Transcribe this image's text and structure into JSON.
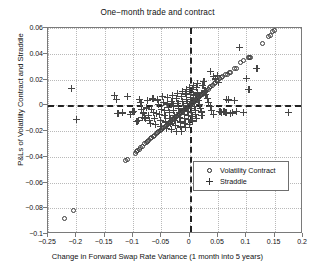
{
  "chart_data": {
    "type": "scatter",
    "title": "One−month trade and contract",
    "xlabel": "Change in Forward Swap Rate Variance (1 month into 5 years)",
    "ylabel": "P&Ls of Volatility Contract and Straddle",
    "xlim": [
      -0.25,
      0.2
    ],
    "ylim": [
      -0.1,
      0.06
    ],
    "xticks": [
      -0.25,
      -0.2,
      -0.15,
      -0.1,
      -0.05,
      0,
      0.05,
      0.1,
      0.15,
      0.2
    ],
    "xtick_labels": [
      "−0.25",
      "−0.2",
      "−0.15",
      "−0.1",
      "−0.05",
      "0",
      "0.05",
      "0.1",
      "0.15",
      "0.2"
    ],
    "yticks": [
      0.06,
      0.04,
      0.02,
      0,
      -0.02,
      -0.04,
      -0.06,
      -0.08,
      -0.1
    ],
    "ytick_labels": [
      "0.06",
      "0.04",
      "0.02",
      "0",
      "−0.02",
      "−0.04",
      "−0.06",
      "−0.08",
      "−0.1"
    ],
    "grid": true,
    "grid_style": "dotted",
    "reference_lines": {
      "vertical_x": 0,
      "horizontal_y": 0,
      "style": "dashed"
    },
    "legend": {
      "position": "lower-right",
      "entries": [
        {
          "label": "Volatility Contract",
          "marker": "circle"
        },
        {
          "label": "Straddle",
          "marker": "plus"
        }
      ]
    },
    "series": [
      {
        "name": "Volatility Contract",
        "marker": "circle",
        "points": [
          [
            -0.2205,
            -0.0882
          ],
          [
            -0.2045,
            -0.0818
          ],
          [
            -0.1135,
            -0.0428
          ],
          [
            -0.1105,
            -0.0425
          ],
          [
            -0.0955,
            -0.0372
          ],
          [
            -0.094,
            -0.036
          ],
          [
            -0.0925,
            -0.0352
          ],
          [
            -0.089,
            -0.034
          ],
          [
            -0.0862,
            -0.033
          ],
          [
            -0.084,
            -0.0318
          ],
          [
            -0.0795,
            -0.03
          ],
          [
            -0.077,
            -0.0292
          ],
          [
            -0.0742,
            -0.028
          ],
          [
            -0.0718,
            -0.0272
          ],
          [
            -0.069,
            -0.0262
          ],
          [
            -0.0665,
            -0.025
          ],
          [
            -0.064,
            -0.0242
          ],
          [
            -0.0615,
            -0.0232
          ],
          [
            -0.0592,
            -0.0222
          ],
          [
            -0.0568,
            -0.0215
          ],
          [
            -0.0545,
            -0.0205
          ],
          [
            -0.0522,
            -0.0196
          ],
          [
            -0.05,
            -0.0188
          ],
          [
            -0.0478,
            -0.018
          ],
          [
            -0.0456,
            -0.0172
          ],
          [
            -0.0435,
            -0.0164
          ],
          [
            -0.0414,
            -0.0156
          ],
          [
            -0.0394,
            -0.0148
          ],
          [
            -0.0374,
            -0.0141
          ],
          [
            -0.0355,
            -0.0134
          ],
          [
            -0.0336,
            -0.0126
          ],
          [
            -0.0318,
            -0.012
          ],
          [
            -0.03,
            -0.0113
          ],
          [
            -0.0283,
            -0.0106
          ],
          [
            -0.0266,
            -0.01
          ],
          [
            -0.025,
            -0.0094
          ],
          [
            -0.0234,
            -0.0088
          ],
          [
            -0.0218,
            -0.0082
          ],
          [
            -0.0203,
            -0.0076
          ],
          [
            -0.0188,
            -0.007
          ],
          [
            -0.0174,
            -0.0065
          ],
          [
            -0.016,
            -0.006
          ],
          [
            -0.0146,
            -0.0054
          ],
          [
            -0.0133,
            -0.0049
          ],
          [
            -0.012,
            -0.0044
          ],
          [
            -0.0107,
            -0.004
          ],
          [
            -0.0095,
            -0.0035
          ],
          [
            -0.0083,
            -0.003
          ],
          [
            -0.0071,
            -0.0026
          ],
          [
            -0.006,
            -0.0022
          ],
          [
            -0.0049,
            -0.0018
          ],
          [
            -0.0038,
            -0.0014
          ],
          [
            -0.0028,
            -0.001
          ],
          [
            -0.0018,
            -0.0006
          ],
          [
            -0.0008,
            -0.0002
          ],
          [
            0.0002,
            0.0001
          ],
          [
            0.0012,
            0.0005
          ],
          [
            0.0022,
            0.0008
          ],
          [
            0.0032,
            0.0012
          ],
          [
            0.0042,
            0.0016
          ],
          [
            0.0052,
            0.002
          ],
          [
            0.0063,
            0.0024
          ],
          [
            0.0074,
            0.0028
          ],
          [
            0.0085,
            0.0032
          ],
          [
            0.0097,
            0.0037
          ],
          [
            0.0109,
            0.0042
          ],
          [
            0.0122,
            0.0047
          ],
          [
            0.0135,
            0.0052
          ],
          [
            0.0149,
            0.0057
          ],
          [
            0.0163,
            0.0062
          ],
          [
            0.0178,
            0.0068
          ],
          [
            0.0194,
            0.0074
          ],
          [
            0.021,
            0.008
          ],
          [
            0.0227,
            0.0087
          ],
          [
            0.0245,
            0.0094
          ],
          [
            0.0264,
            0.0101
          ],
          [
            0.0284,
            0.0109
          ],
          [
            0.0305,
            0.0117
          ],
          [
            0.0327,
            0.0126
          ],
          [
            0.0351,
            0.0135
          ],
          [
            0.0376,
            0.0145
          ],
          [
            0.0403,
            0.0155
          ],
          [
            0.0432,
            0.0166
          ],
          [
            0.0463,
            0.0178
          ],
          [
            0.0496,
            0.0191
          ],
          [
            0.0532,
            0.0204
          ],
          [
            0.056,
            0.0215
          ],
          [
            0.0588,
            0.0226
          ],
          [
            0.0635,
            0.0238
          ],
          [
            0.0665,
            0.024
          ],
          [
            0.07,
            0.0252
          ],
          [
            0.0728,
            0.0254
          ],
          [
            0.079,
            0.0282
          ],
          [
            0.082,
            0.0288
          ],
          [
            0.0905,
            0.033
          ],
          [
            0.0948,
            0.0345
          ],
          [
            0.1035,
            0.0368
          ],
          [
            0.1062,
            0.037
          ],
          [
            0.108,
            0.0372
          ],
          [
            0.129,
            0.0478
          ],
          [
            0.1385,
            0.0532
          ],
          [
            0.1425,
            0.0545
          ],
          [
            0.147,
            0.057
          ],
          [
            0.1498,
            0.0578
          ]
        ]
      },
      {
        "name": "Straddle",
        "marker": "plus",
        "points": [
          [
            -0.208,
            0.0133
          ],
          [
            -0.2,
            -0.0112
          ],
          [
            -0.133,
            0.0078
          ],
          [
            -0.13,
            0.0043
          ],
          [
            -0.1265,
            -0.0065
          ],
          [
            -0.118,
            -0.006
          ],
          [
            -0.1095,
            0.007
          ],
          [
            -0.105,
            -0.0072
          ],
          [
            -0.1005,
            -0.0052
          ],
          [
            -0.0985,
            -0.0048
          ],
          [
            -0.093,
            -0.0128
          ],
          [
            -0.091,
            -0.012
          ],
          [
            -0.088,
            0.0045
          ],
          [
            -0.0862,
            0.0025
          ],
          [
            -0.0855,
            -0.0035
          ],
          [
            -0.084,
            -0.0092
          ],
          [
            -0.082,
            -0.006
          ],
          [
            -0.08,
            -0.0098
          ],
          [
            -0.0785,
            -0.0105
          ],
          [
            -0.077,
            -0.002
          ],
          [
            -0.0742,
            0.0035
          ],
          [
            -0.0725,
            -0.008
          ],
          [
            -0.0706,
            -0.012
          ],
          [
            -0.069,
            -0.0138
          ],
          [
            -0.067,
            -0.0032
          ],
          [
            -0.065,
            0.005
          ],
          [
            -0.064,
            -0.0055
          ],
          [
            -0.062,
            -0.01
          ],
          [
            -0.0605,
            -0.015
          ],
          [
            -0.0588,
            -0.0062
          ],
          [
            -0.057,
            0.0042
          ],
          [
            -0.0556,
            0.0008
          ],
          [
            -0.054,
            -0.007
          ],
          [
            -0.0522,
            -0.0115
          ],
          [
            -0.0508,
            -0.0165
          ],
          [
            -0.0495,
            -0.0035
          ],
          [
            -0.048,
            0.0068
          ],
          [
            -0.0466,
            0.002
          ],
          [
            -0.0452,
            -0.004
          ],
          [
            -0.0438,
            -0.0082
          ],
          [
            -0.0425,
            -0.013
          ],
          [
            -0.0412,
            -0.0178
          ],
          [
            -0.04,
            0.001
          ],
          [
            -0.0388,
            0.006
          ],
          [
            -0.0375,
            -0.0015
          ],
          [
            -0.0362,
            -0.0058
          ],
          [
            -0.035,
            -0.01
          ],
          [
            -0.0338,
            -0.0145
          ],
          [
            -0.0326,
            -0.019
          ],
          [
            -0.0315,
            0.003
          ],
          [
            -0.0303,
            0.0078
          ],
          [
            -0.0292,
            -0.0005
          ],
          [
            -0.0281,
            -0.004
          ],
          [
            -0.027,
            -0.0078
          ],
          [
            -0.0259,
            -0.0118
          ],
          [
            -0.0248,
            -0.0158
          ],
          [
            -0.0238,
            -0.02
          ],
          [
            -0.0228,
            0.0052
          ],
          [
            -0.0218,
            0.0095
          ],
          [
            -0.0208,
            0.0012
          ],
          [
            -0.0198,
            -0.0022
          ],
          [
            -0.0188,
            -0.0055
          ],
          [
            -0.0178,
            -0.0092
          ],
          [
            -0.0169,
            -0.013
          ],
          [
            -0.016,
            -0.0168
          ],
          [
            -0.0151,
            -0.0205
          ],
          [
            -0.0142,
            0.007
          ],
          [
            -0.0133,
            0.011
          ],
          [
            -0.0124,
            0.0028
          ],
          [
            -0.0116,
            -0.0002
          ],
          [
            -0.0108,
            -0.0034
          ],
          [
            -0.01,
            -0.0068
          ],
          [
            -0.0092,
            -0.0102
          ],
          [
            -0.0084,
            -0.0138
          ],
          [
            -0.0076,
            -0.0175
          ],
          [
            -0.0068,
            0.0088
          ],
          [
            -0.006,
            0.0125
          ],
          [
            -0.0053,
            0.0045
          ],
          [
            -0.0046,
            0.0015
          ],
          [
            -0.0039,
            -0.0014
          ],
          [
            -0.0032,
            -0.0046
          ],
          [
            -0.0025,
            -0.0078
          ],
          [
            -0.0018,
            -0.0112
          ],
          [
            -0.0011,
            -0.0148
          ],
          [
            -0.0005,
            0.0105
          ],
          [
            0.0002,
            0.014
          ],
          [
            0.0008,
            0.0062
          ],
          [
            0.0014,
            0.0032
          ],
          [
            0.002,
            0.0004
          ],
          [
            0.0026,
            -0.0026
          ],
          [
            0.0032,
            -0.0056
          ],
          [
            0.0038,
            -0.0088
          ],
          [
            0.0045,
            -0.0122
          ],
          [
            0.0052,
            0.0122
          ],
          [
            0.0059,
            0.0155
          ],
          [
            0.0066,
            0.008
          ],
          [
            0.0073,
            0.005
          ],
          [
            0.008,
            0.0022
          ],
          [
            0.0088,
            -0.0008
          ],
          [
            0.0096,
            -0.0038
          ],
          [
            0.0104,
            -0.007
          ],
          [
            0.0113,
            -0.0102
          ],
          [
            0.0122,
            0.0138
          ],
          [
            0.0132,
            0.017
          ],
          [
            0.0142,
            0.0096
          ],
          [
            0.0152,
            0.0066
          ],
          [
            0.0163,
            0.0038
          ],
          [
            0.0175,
            0.0008
          ],
          [
            0.0188,
            -0.0022
          ],
          [
            0.0202,
            -0.0052
          ],
          [
            0.0217,
            -0.0082
          ],
          [
            0.0233,
            0.0152
          ],
          [
            0.025,
            0.0185
          ],
          [
            0.0268,
            0.0112
          ],
          [
            0.0288,
            0.0082
          ],
          [
            0.031,
            0.0052
          ],
          [
            0.0334,
            0.0022
          ],
          [
            0.036,
            -0.0008
          ],
          [
            0.0388,
            -0.004
          ],
          [
            0.0418,
            -0.007
          ],
          [
            0.0365,
            0.0262
          ],
          [
            0.0425,
            0.0226
          ],
          [
            0.0455,
            0.0205
          ],
          [
            0.0488,
            0.0232
          ],
          [
            0.051,
            0.018
          ],
          [
            0.0535,
            -0.005
          ],
          [
            0.056,
            -0.0058
          ],
          [
            0.0605,
            -0.0045
          ],
          [
            0.064,
            -0.0055
          ],
          [
            0.0655,
            0.0048
          ],
          [
            0.0688,
            0.0042
          ],
          [
            0.0712,
            -0.0062
          ],
          [
            0.076,
            -0.006
          ],
          [
            0.0795,
            0.004
          ],
          [
            0.083,
            -0.005
          ],
          [
            0.088,
            0.045
          ],
          [
            0.0945,
            -0.0058
          ],
          [
            0.1005,
            0.021
          ],
          [
            0.1045,
            0.0125
          ],
          [
            0.1185,
            0.0285
          ],
          [
            0.174,
            -0.0058
          ]
        ]
      }
    ]
  }
}
